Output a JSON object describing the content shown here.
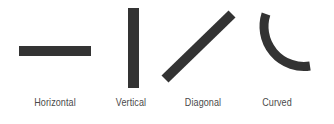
{
  "colors": {
    "stroke": "#333333",
    "label": "#4a4a4a",
    "background": "#ffffff"
  },
  "items": [
    {
      "label": "Horizontal",
      "shape": "horizontal-line"
    },
    {
      "label": "Vertical",
      "shape": "vertical-line"
    },
    {
      "label": "Diagonal",
      "shape": "diagonal-line"
    },
    {
      "label": "Curved",
      "shape": "curved-line"
    }
  ]
}
